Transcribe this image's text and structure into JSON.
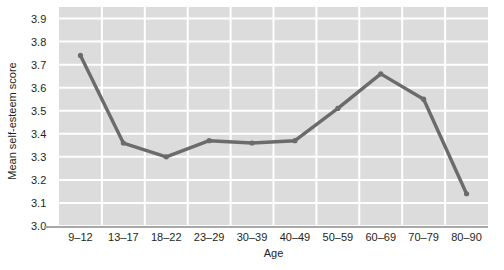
{
  "chart_data": {
    "type": "line",
    "title": "",
    "xlabel": "Age",
    "ylabel": "Mean self-esteem score",
    "categories": [
      "9–12",
      "13–17",
      "18–22",
      "23–29",
      "30–39",
      "40–49",
      "50–59",
      "60–69",
      "70–79",
      "80–90"
    ],
    "values": [
      3.74,
      3.36,
      3.3,
      3.37,
      3.36,
      3.37,
      3.51,
      3.66,
      3.55,
      3.14
    ],
    "series": [
      {
        "name": "Mean self-esteem score",
        "values": [
          3.74,
          3.36,
          3.3,
          3.37,
          3.36,
          3.37,
          3.51,
          3.66,
          3.55,
          3.14
        ]
      }
    ],
    "ylim": [
      3.0,
      3.95
    ],
    "yticks": [
      "3.0",
      "3.1",
      "3.2",
      "3.3",
      "3.4",
      "3.5",
      "3.6",
      "3.7",
      "3.8",
      "3.9"
    ],
    "ytick_values": [
      3.0,
      3.1,
      3.2,
      3.3,
      3.4,
      3.5,
      3.6,
      3.7,
      3.8,
      3.9
    ],
    "grid": true,
    "grid_color": "#ffffff",
    "plot_background": "#dcdcdc",
    "legend": "none",
    "line_color": "#6b6b6b",
    "marker_color": "#6b6b6b",
    "text_color": "#231f20",
    "axis_color": "#a8a8a8"
  }
}
